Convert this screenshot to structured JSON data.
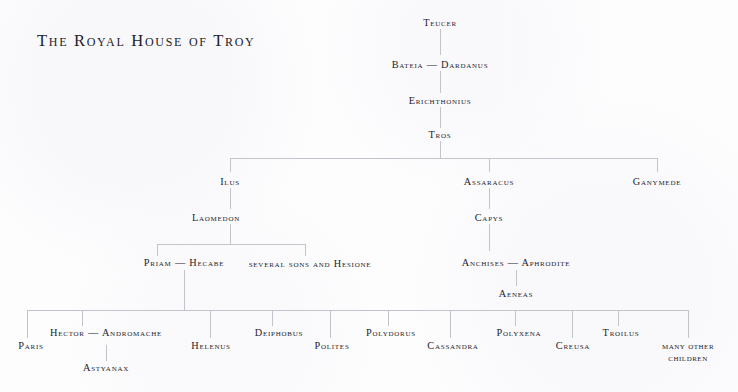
{
  "title": "The Royal House of Troy",
  "colors": {
    "background": "#fdfdfe",
    "text": "#24242b",
    "line": "#c2c4cb"
  },
  "nodes": {
    "teucer": "Teucer",
    "bateia_dardanus": "Bateia — Dardanus",
    "erichthonius": "Erichthonius",
    "tros": "Tros",
    "ilus": "Ilus",
    "assaracus": "Assaracus",
    "ganymede": "Ganymede",
    "laomedon": "Laomedon",
    "capys": "Capys",
    "priam_hecabe": "Priam — Hecabe",
    "several_sons": "several sons and Hesione",
    "anchises_aphrodite": "Anchises — Aphrodite",
    "aeneas": "Aeneas",
    "paris": "Paris",
    "hector_andromache": "Hector — Andromache",
    "helenus": "Helenus",
    "deiphobus": "Deiphobus",
    "polites": "Polites",
    "polydorus": "Polydorus",
    "cassandra": "Cassandra",
    "polyxena": "Polyxena",
    "creusa": "Creusa",
    "troilus": "Troilus",
    "many_other_children_line1": "many other",
    "many_other_children_line2": "children",
    "astyanax": "Astyanax"
  }
}
